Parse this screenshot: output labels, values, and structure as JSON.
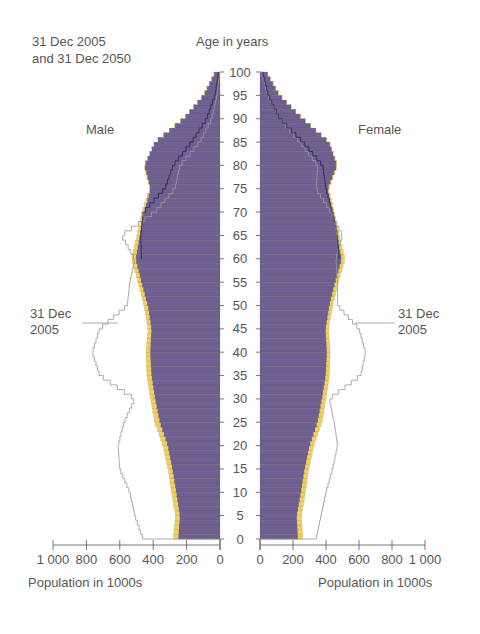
{
  "header": {
    "date_line1": "31 Dec 2005",
    "date_line2": "and 31 Dec 2050",
    "age_axis_title": "Age in years",
    "male_label": "Male",
    "female_label": "Female",
    "annotation_left_1": "31 Dec",
    "annotation_left_2": "2005",
    "annotation_right_1": "31 Dec",
    "annotation_right_2": "2005",
    "xlabel_left": "Population in 1000s",
    "xlabel_right": "Population in 1000s"
  },
  "colors": {
    "bar_2050": "#6e5f94",
    "bar_2050_stripe": "#5d4f82",
    "surplus": "#f0d060",
    "outline_2005": "#999999",
    "line_inner": "#2a2350",
    "axis": "#555555"
  },
  "chart_data": {
    "type": "bar",
    "subtype": "population-pyramid",
    "ylabel": "Age in years",
    "xlabel": "Population in 1000s",
    "age_ticks": [
      0,
      5,
      10,
      15,
      20,
      25,
      30,
      35,
      40,
      45,
      50,
      55,
      60,
      65,
      70,
      75,
      80,
      85,
      90,
      95,
      100
    ],
    "x_ticks": [
      0,
      200,
      400,
      600,
      800,
      1000
    ],
    "x_tick_labels": [
      "0",
      "200",
      "400",
      "600",
      "800",
      "1 000"
    ],
    "xlim": [
      0,
      1000
    ],
    "ylim": [
      0,
      100
    ],
    "knot_ages": [
      0,
      5,
      10,
      15,
      20,
      25,
      30,
      35,
      40,
      45,
      50,
      55,
      60,
      65,
      70,
      75,
      80,
      85,
      90,
      95,
      100
    ],
    "series": [
      {
        "name": "Male 2050 (outer, yellow edge)",
        "side": "left",
        "values": [
          280,
          265,
          290,
          310,
          340,
          390,
          415,
          437,
          443,
          430,
          455,
          490,
          530,
          495,
          467,
          420,
          455,
          390,
          220,
          100,
          30
        ]
      },
      {
        "name": "Male 2050 (purple)",
        "side": "left",
        "values": [
          250,
          240,
          262,
          285,
          312,
          360,
          388,
          410,
          418,
          410,
          432,
          470,
          505,
          480,
          455,
          415,
          452,
          388,
          218,
          98,
          28
        ]
      },
      {
        "name": "Male 2005 (outline)",
        "side": "left",
        "values": [
          460,
          510,
          540,
          600,
          610,
          575,
          510,
          720,
          765,
          720,
          555,
          540,
          510,
          590,
          390,
          270,
          240,
          120,
          50,
          18,
          3
        ]
      },
      {
        "name": "Female 2050 (outer, yellow edge)",
        "side": "right",
        "values": [
          260,
          250,
          275,
          295,
          325,
          375,
          400,
          420,
          425,
          415,
          440,
          475,
          515,
          480,
          450,
          415,
          470,
          420,
          260,
          120,
          40
        ]
      },
      {
        "name": "Female 2050 (purple)",
        "side": "right",
        "values": [
          230,
          222,
          248,
          270,
          300,
          348,
          375,
          398,
          405,
          397,
          420,
          455,
          495,
          465,
          440,
          410,
          466,
          418,
          258,
          118,
          38
        ]
      },
      {
        "name": "Female 2005 (outline)",
        "side": "right",
        "values": [
          340,
          370,
          400,
          440,
          470,
          450,
          420,
          610,
          640,
          600,
          470,
          470,
          460,
          500,
          430,
          340,
          350,
          240,
          120,
          45,
          8
        ]
      },
      {
        "name": "2005 inner line (male)",
        "side": "left",
        "values": [
          null,
          null,
          null,
          null,
          null,
          null,
          null,
          null,
          null,
          null,
          null,
          null,
          470,
          475,
          460,
          330,
          280,
          170,
          80,
          30,
          8
        ]
      },
      {
        "name": "2005 inner line (female)",
        "side": "right",
        "values": [
          null,
          null,
          null,
          null,
          null,
          null,
          null,
          null,
          null,
          null,
          null,
          null,
          480,
          470,
          440,
          400,
          380,
          260,
          120,
          50,
          15
        ]
      }
    ]
  }
}
